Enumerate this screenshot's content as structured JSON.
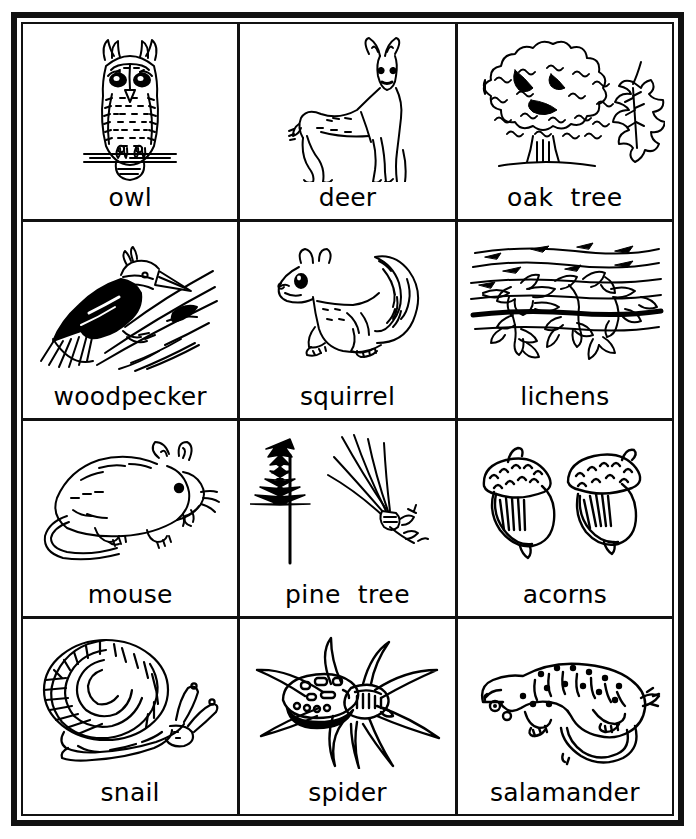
{
  "worksheet": {
    "title": "Forest Organisms Picture Cards",
    "frame_color": "#111111",
    "background_color": "#ffffff",
    "ink_color": "#000000",
    "columns": 3,
    "rows": 4
  },
  "cells": [
    {
      "id": "owl",
      "label": "owl",
      "icon": "owl-illustration"
    },
    {
      "id": "deer",
      "label": "deer",
      "icon": "deer-illustration"
    },
    {
      "id": "oak-tree",
      "label": "oak  tree",
      "icon": "oak-tree-illustration"
    },
    {
      "id": "woodpecker",
      "label": "woodpecker",
      "icon": "woodpecker-illustration"
    },
    {
      "id": "squirrel",
      "label": "squirrel",
      "icon": "squirrel-illustration"
    },
    {
      "id": "lichens",
      "label": "lichens",
      "icon": "lichens-illustration"
    },
    {
      "id": "mouse",
      "label": "mouse",
      "icon": "mouse-illustration"
    },
    {
      "id": "pine-tree",
      "label": "pine  tree",
      "icon": "pine-tree-illustration"
    },
    {
      "id": "acorns",
      "label": "acorns",
      "icon": "acorns-illustration"
    },
    {
      "id": "snail",
      "label": "snail",
      "icon": "snail-illustration"
    },
    {
      "id": "spider",
      "label": "spider",
      "icon": "spider-illustration"
    },
    {
      "id": "salamander",
      "label": "salamander",
      "icon": "salamander-illustration"
    }
  ]
}
